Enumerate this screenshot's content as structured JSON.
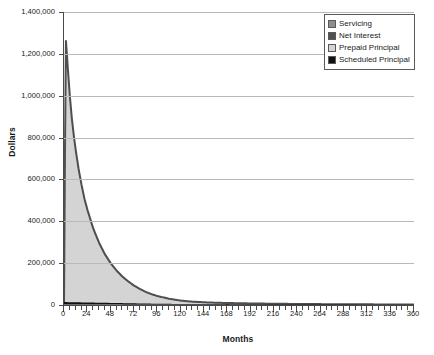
{
  "chart_data": {
    "type": "area",
    "title": "",
    "xlabel": "Months",
    "ylabel": "Dollars",
    "xlim": [
      0,
      360
    ],
    "ylim": [
      0,
      1400000
    ],
    "grid": true,
    "legend_position": "top-right",
    "x_tick_step": 24,
    "x_minor_tick_step": 6,
    "y_tick_step": 200000,
    "x_ticks": [
      0,
      24,
      48,
      72,
      96,
      120,
      144,
      168,
      192,
      216,
      240,
      264,
      288,
      312,
      336,
      360
    ],
    "x_tick_labels": [
      "0",
      "24",
      "48",
      "72",
      "96",
      "120",
      "144",
      "168",
      "192",
      "216",
      "240",
      "264",
      "288",
      "312",
      "336",
      "360"
    ],
    "y_ticks": [
      0,
      200000,
      400000,
      600000,
      800000,
      1000000,
      1200000,
      1400000
    ],
    "y_tick_labels": [
      "0",
      "200,000",
      "400,000",
      "600,000",
      "800,000",
      "1,000,000",
      "1,200,000",
      "1,400,000"
    ],
    "legend": [
      {
        "name": "Servicing",
        "color": "#8d8d8d"
      },
      {
        "name": "Net Interest",
        "color": "#4f4f4f"
      },
      {
        "name": "Prepaid Principal",
        "color": "#d4d4d4"
      },
      {
        "name": "Scheduled Principal",
        "color": "#111111"
      }
    ],
    "series": [
      {
        "name": "Prepaid Principal",
        "color": "#d4d4d4",
        "x": [
          0,
          1,
          2,
          3,
          4,
          6,
          8,
          10,
          12,
          15,
          18,
          21,
          24,
          30,
          36,
          42,
          48,
          54,
          60,
          66,
          72,
          78,
          84,
          90,
          96,
          108,
          120,
          132,
          144,
          156,
          168,
          180,
          192,
          216,
          240,
          264,
          288,
          312,
          336,
          360
        ],
        "values": [
          0,
          700000,
          1245000,
          1180000,
          1110000,
          985000,
          880000,
          800000,
          730000,
          640000,
          565000,
          500000,
          448000,
          360000,
          292000,
          238000,
          196000,
          161000,
          133000,
          110000,
          90000,
          74000,
          61000,
          50000,
          41000,
          28000,
          19000,
          14000,
          11000,
          9000,
          7500,
          6500,
          5500,
          4000,
          3000,
          2200,
          1600,
          1100,
          700,
          300
        ]
      },
      {
        "name": "Net Interest",
        "color": "#4f4f4f",
        "x": [
          0,
          1,
          2,
          3,
          4,
          6,
          8,
          10,
          12,
          15,
          18,
          21,
          24,
          30,
          36,
          42,
          48,
          54,
          60,
          66,
          72,
          78,
          84,
          90,
          96,
          108,
          120,
          132,
          144,
          156,
          168,
          180,
          192,
          216,
          240,
          264,
          288,
          312,
          336,
          360
        ],
        "values": [
          0,
          730000,
          1262000,
          1196000,
          1126000,
          1000000,
          894000,
          813000,
          742000,
          651000,
          575000,
          509000,
          456000,
          367000,
          298000,
          243000,
          200000,
          165000,
          136000,
          113000,
          93000,
          77000,
          63000,
          52000,
          43000,
          30000,
          21000,
          16000,
          13000,
          11000,
          9500,
          8500,
          7500,
          6000,
          5000,
          4200,
          3600,
          3100,
          2700,
          2300
        ]
      },
      {
        "name": "Scheduled Principal",
        "color": "#111111",
        "x": [
          0,
          12,
          24,
          48,
          72,
          96,
          120,
          180,
          240,
          300,
          360
        ],
        "values": [
          14000,
          13000,
          12000,
          10000,
          8000,
          6000,
          5000,
          4000,
          3500,
          3000,
          2600
        ]
      },
      {
        "name": "Servicing",
        "color": "#8d8d8d",
        "x": [
          0,
          12,
          24,
          48,
          72,
          96,
          120,
          180,
          240,
          300,
          360
        ],
        "values": [
          4000,
          3800,
          3600,
          3200,
          2800,
          2400,
          2100,
          1700,
          1400,
          1200,
          1000
        ]
      }
    ]
  },
  "colors": {
    "axis": "#4a4a4a",
    "gridline": "#b9b9b9",
    "background": "#ffffff",
    "area_fill": "#d4d4d4",
    "curve_edge": "#4f4f4f",
    "baseline_band": "#111111"
  }
}
